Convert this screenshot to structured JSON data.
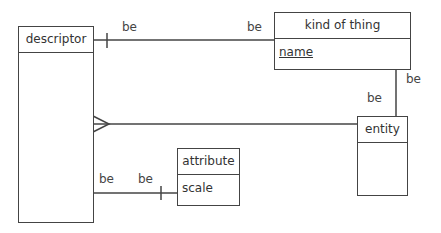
{
  "entities": [
    {
      "name": "descriptor",
      "attributes": []
    },
    {
      "name": "kind of thing",
      "attributes": [
        {
          "label": "name",
          "underlined": true
        }
      ]
    },
    {
      "name": "entity",
      "attributes": []
    },
    {
      "name": "attribute",
      "attributes": [
        {
          "label": "scale",
          "underlined": false
        }
      ]
    }
  ],
  "relationships": [
    {
      "from": "descriptor",
      "to": "kind of thing",
      "from_label": "be",
      "to_label": "be",
      "from_end": "one",
      "to_end": "none"
    },
    {
      "from": "kind of thing",
      "to": "entity",
      "from_label": "be",
      "to_label": "be",
      "from_end": "none",
      "to_end": "none"
    },
    {
      "from": "descriptor",
      "to": "entity",
      "from_end": "many",
      "to_end": "none"
    },
    {
      "from": "descriptor",
      "to": "attribute",
      "from_label": "be",
      "to_label": "be",
      "from_end": "none",
      "to_end": "one"
    }
  ],
  "labels": {
    "be": "be"
  }
}
